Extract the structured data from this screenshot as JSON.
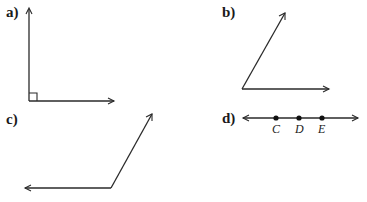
{
  "figures": [
    {
      "label": "a)",
      "type": "right-angle",
      "description": "Right angle with square marker at vertex"
    },
    {
      "label": "b)",
      "type": "acute-angle",
      "description": "Acute angle opening to the upper right"
    },
    {
      "label": "c)",
      "type": "obtuse-angle",
      "description": "Obtuse angle with ray pointing left"
    },
    {
      "label": "d)",
      "type": "line",
      "points": [
        "C",
        "D",
        "E"
      ]
    }
  ]
}
